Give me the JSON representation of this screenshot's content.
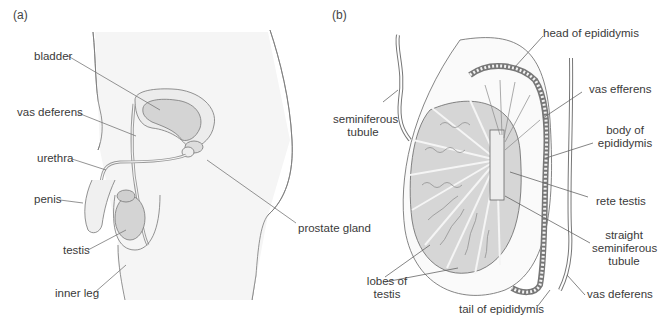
{
  "panels": [
    {
      "id": "a",
      "label": "(a)",
      "labels": {
        "bladder": "bladder",
        "vas_deferens": "vas deferens",
        "urethra": "urethra",
        "penis": "penis",
        "testis": "testis",
        "inner_leg": "inner leg",
        "prostate_gland": "prostate gland"
      }
    },
    {
      "id": "b",
      "label": "(b)",
      "labels": {
        "head_of_epididymis": "head of epididymis",
        "vas_efferens": "vas efferens",
        "seminiferous_tubule_1": "seminiferous",
        "seminiferous_tubule_2": "tubule",
        "body_of_epididymis_1": "body of",
        "body_of_epididymis_2": "epididymis",
        "rete_testis": "rete testis",
        "straight_1": "straight",
        "straight_2": "seminiferous",
        "straight_3": "tubule",
        "lobes_1": "lobes of",
        "lobes_2": "testis",
        "tail_of_epididymis": "tail of epididymis",
        "vas_deferens": "vas deferens"
      }
    }
  ],
  "colors": {
    "organ_fill": "#d9d9d9",
    "body_fill": "#f4f4f4",
    "line": "#666666"
  }
}
